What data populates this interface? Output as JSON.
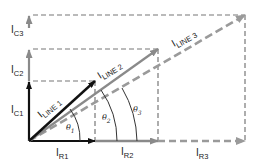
{
  "diagram": {
    "type": "phasor-diagram",
    "colors": {
      "line1": "#111111",
      "line2": "#8a8a8a",
      "line3": "#9a9a9a",
      "dashed_guides": "#777777",
      "angle_arcs": "#333333",
      "text": "#222222"
    },
    "vectors": [
      {
        "id": "ic1",
        "label": "I",
        "sub": "C1",
        "style": "solid-black"
      },
      {
        "id": "ic2",
        "label": "I",
        "sub": "C2",
        "style": "solid-gray"
      },
      {
        "id": "ic3",
        "label": "I",
        "sub": "C3",
        "style": "solid-gray"
      },
      {
        "id": "ir1",
        "label": "I",
        "sub": "R1",
        "style": "solid-black"
      },
      {
        "id": "ir2",
        "label": "I",
        "sub": "R2",
        "style": "solid-gray"
      },
      {
        "id": "ir3",
        "label": "I",
        "sub": "R3",
        "style": "dashed-gray"
      },
      {
        "id": "iline1",
        "label": "I",
        "sub": "LINE 1",
        "style": "solid-black"
      },
      {
        "id": "iline2",
        "label": "I",
        "sub": "LINE 2",
        "style": "solid-gray"
      },
      {
        "id": "iline3",
        "label": "I",
        "sub": "LINE 3",
        "style": "dashed-gray"
      }
    ],
    "angles": [
      {
        "id": "theta1",
        "symbol": "θ",
        "sub": "1"
      },
      {
        "id": "theta2",
        "symbol": "θ",
        "sub": "2"
      },
      {
        "id": "theta3",
        "symbol": "θ",
        "sub": "3"
      }
    ]
  }
}
